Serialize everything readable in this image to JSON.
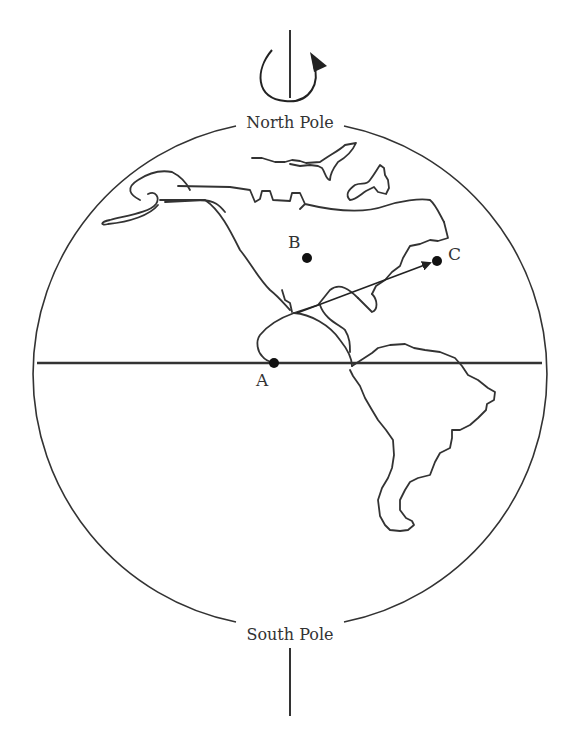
{
  "figure": {
    "labels": {
      "north_pole": "North Pole",
      "south_pole": "South Pole",
      "point_a": "A",
      "point_b": "B",
      "point_c": "C"
    },
    "rotation_direction": "counterclockwise (viewed from above North Pole)",
    "arrow": {
      "from": "near A",
      "to": "C"
    },
    "colors": {
      "ink": "#333333",
      "background": "#ffffff"
    },
    "icons": [
      "rotation-arrow-icon"
    ]
  }
}
